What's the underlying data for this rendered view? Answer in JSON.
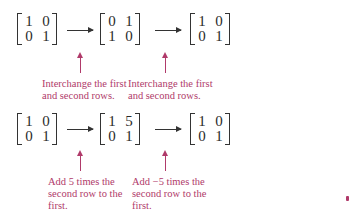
{
  "colors": {
    "annotation": "#b03a6a",
    "math": "#333333",
    "background": "#ffffff"
  },
  "row1": {
    "matrices": [
      {
        "cells": [
          [
            "1",
            "0"
          ],
          [
            "0",
            "1"
          ]
        ]
      },
      {
        "cells": [
          [
            "0",
            "1"
          ],
          [
            "1",
            "0"
          ]
        ]
      },
      {
        "cells": [
          [
            "1",
            "0"
          ],
          [
            "0",
            "1"
          ]
        ]
      }
    ],
    "captions": [
      "Interchange the first\nand second rows.",
      "Interchange the first\nand second rows."
    ]
  },
  "row2": {
    "matrices": [
      {
        "cells": [
          [
            "1",
            "0"
          ],
          [
            "0",
            "1"
          ]
        ]
      },
      {
        "cells": [
          [
            "1",
            "5"
          ],
          [
            "0",
            "1"
          ]
        ]
      },
      {
        "cells": [
          [
            "1",
            "0"
          ],
          [
            "0",
            "1"
          ]
        ]
      }
    ],
    "captions": [
      "Add 5 times the\nsecond row to the\nfirst.",
      "Add −5 times the\nsecond row to the\nfirst."
    ]
  }
}
